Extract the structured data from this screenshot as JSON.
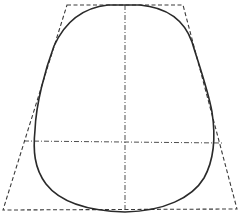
{
  "diagram": {
    "type": "geometric-construction",
    "colors": {
      "background": "#ffffff",
      "outline": "#2a2a2a",
      "construction": "#3a3a3a"
    },
    "trapezoid": {
      "points": "67,5 183,5 237,209 3,210"
    },
    "axes": {
      "vertical": {
        "x1": 125,
        "y1": 5,
        "x2": 125,
        "y2": 212
      },
      "horizontal": {
        "x1": 24,
        "y1": 141,
        "x2": 222,
        "y2": 143
      }
    },
    "outline_path": "M 108,5 L 140,5 C 172,8 186,25 192,42 C 198,62 208,90 212,112 C 216,138 214,160 204,178 C 192,198 164,211 125,212 C 88,211 60,202 46,184 C 34,168 33,150 35,130 C 36,104 45,70 54,46 C 64,24 80,8 108,5 Z"
  }
}
